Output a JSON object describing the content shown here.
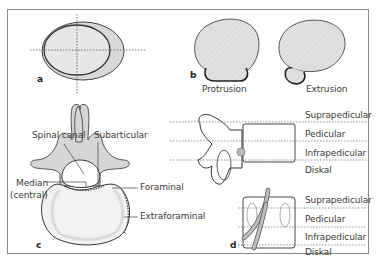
{
  "figure": {
    "colors": {
      "frame": "#8a8a8a",
      "outline": "#333333",
      "fill_gray": "#d9d9d9",
      "fill_light": "#f2f2f2",
      "dotted_line": "#666666",
      "text": "#3a3a3a"
    },
    "panels": {
      "a": {
        "letter": "a"
      },
      "b": {
        "letter": "b",
        "labels": {
          "protrusion": "Protrusion",
          "extrusion": "Extrusion"
        }
      },
      "c": {
        "letter": "c",
        "labels": {
          "spinal_canal": "Spinal canal",
          "subarticular": "Subarticular",
          "median_line1": "Median",
          "median_line2": "(central)",
          "foraminal": "Foraminal",
          "extraforaminal": "Extraforaminal"
        }
      },
      "side_view": {
        "levels": [
          "Suprapedicular",
          "Pedicular",
          "Infrapedicular",
          "Diskal"
        ]
      },
      "d": {
        "letter": "d",
        "levels": [
          "Suprapedicular",
          "Pedicular",
          "Infrapedicular",
          "Diskal"
        ]
      }
    }
  }
}
